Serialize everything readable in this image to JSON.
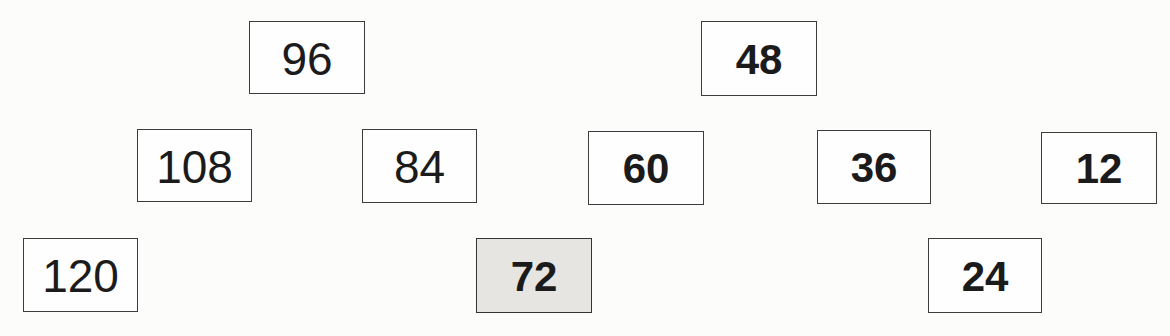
{
  "document": {
    "kind": "number-pattern-worksheet",
    "pattern_rule": "counting back by 12",
    "background_color": "#fcfcfb"
  },
  "colors": {
    "box_border": "#3c3c3c",
    "box_fill": "#fefefe",
    "highlight_fill": "#e6e5e1",
    "text": "#1b1b1b"
  },
  "boxes": [
    {
      "value": "120",
      "row": "bottom",
      "weight": "regular",
      "highlighted": false,
      "x": 23,
      "y": 238,
      "w": 115,
      "h": 74
    },
    {
      "value": "108",
      "row": "middle",
      "weight": "regular",
      "highlighted": false,
      "x": 137,
      "y": 129,
      "w": 115,
      "h": 73
    },
    {
      "value": "96",
      "row": "top",
      "weight": "regular",
      "highlighted": false,
      "x": 249,
      "y": 21,
      "w": 116,
      "h": 73
    },
    {
      "value": "84",
      "row": "middle",
      "weight": "regular",
      "highlighted": false,
      "x": 362,
      "y": 129,
      "w": 115,
      "h": 74
    },
    {
      "value": "72",
      "row": "bottom",
      "weight": "bold",
      "highlighted": true,
      "x": 476,
      "y": 238,
      "w": 116,
      "h": 75
    },
    {
      "value": "60",
      "row": "middle",
      "weight": "bold",
      "highlighted": false,
      "x": 588,
      "y": 131,
      "w": 116,
      "h": 74
    },
    {
      "value": "48",
      "row": "top",
      "weight": "bold",
      "highlighted": false,
      "x": 701,
      "y": 21,
      "w": 116,
      "h": 75
    },
    {
      "value": "36",
      "row": "middle",
      "weight": "bold",
      "highlighted": false,
      "x": 817,
      "y": 130,
      "w": 114,
      "h": 74
    },
    {
      "value": "24",
      "row": "bottom",
      "weight": "bold",
      "highlighted": false,
      "x": 928,
      "y": 238,
      "w": 114,
      "h": 75
    },
    {
      "value": "12",
      "row": "middle",
      "weight": "bold",
      "highlighted": false,
      "x": 1041,
      "y": 132,
      "w": 116,
      "h": 72
    }
  ]
}
